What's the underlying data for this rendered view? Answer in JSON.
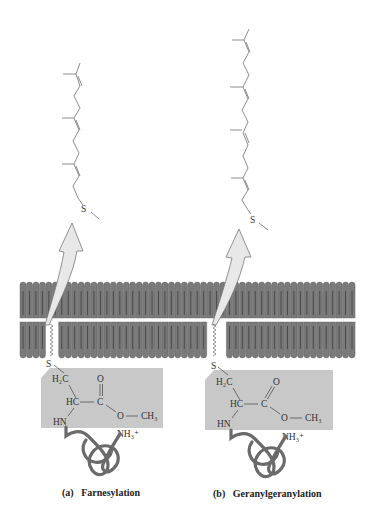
{
  "figure": {
    "panels": [
      {
        "id": "a",
        "label_letter": "(a)",
        "label_text": "Farnesylation",
        "isoprene_units": 3,
        "sulfur": "S",
        "groups": {
          "ch2": "H₂C",
          "hc": "HC",
          "c": "C",
          "o_double": "O",
          "o_ester": "O",
          "methyl": "CH₃",
          "hn": "HN",
          "nh3": "NH₃⁺"
        }
      },
      {
        "id": "b",
        "label_letter": "(b)",
        "label_text": "Geranylgeranylation",
        "isoprene_units": 4,
        "sulfur": "S",
        "groups": {
          "ch2": "H₂C",
          "hc": "HC",
          "c": "C",
          "o_double": "O",
          "o_ester": "O",
          "methyl": "CH₃",
          "hn": "HN",
          "nh3": "NH₃⁺"
        }
      }
    ],
    "colors": {
      "lipid": "#7a7a7a",
      "lipid_edge": "#555555",
      "box": "#c8c8c8",
      "arrow": "#e6e6e6",
      "arrow_edge": "#777777",
      "chain": "#777777",
      "protein": "#6a6a6a"
    }
  }
}
